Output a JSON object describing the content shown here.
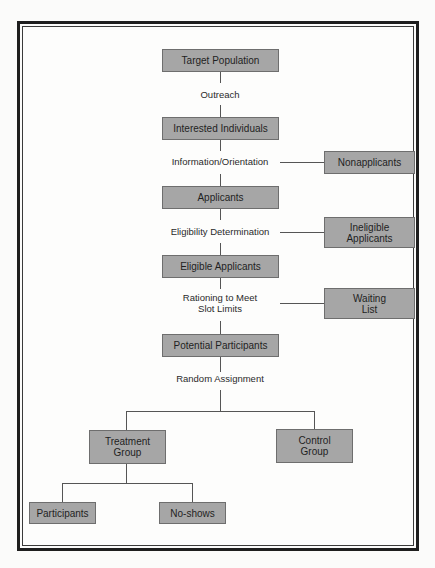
{
  "diagram": {
    "type": "flowchart",
    "main_flow": {
      "nodes": [
        {
          "id": "target_population",
          "label": "Target Population"
        },
        {
          "id": "interested_individuals",
          "label": "Interested Individuals"
        },
        {
          "id": "applicants",
          "label": "Applicants"
        },
        {
          "id": "eligible_applicants",
          "label": "Eligible Applicants"
        },
        {
          "id": "potential_participants",
          "label": "Potential Participants"
        }
      ],
      "steps": [
        {
          "label": "Outreach"
        },
        {
          "label": "Information/Orientation"
        },
        {
          "label": "Eligibility Determination"
        },
        {
          "label": "Rationing to Meet\nSlot Limits"
        },
        {
          "label": "Random Assignment"
        }
      ]
    },
    "side_exits": [
      {
        "from_step": "Information/Orientation",
        "label": "Nonapplicants"
      },
      {
        "from_step": "Eligibility Determination",
        "label": "Ineligible\nApplicants"
      },
      {
        "from_step": "Rationing to Meet Slot Limits",
        "label": "Waiting\nList"
      }
    ],
    "branches": {
      "treatment": {
        "label": "Treatment\nGroup"
      },
      "control": {
        "label": "Control\nGroup"
      },
      "treatment_children": [
        {
          "label": "Participants"
        },
        {
          "label": "No-shows"
        }
      ]
    },
    "colors": {
      "box_fill": "#a6a6a6",
      "frame": "#1e1e1e",
      "line": "#555555"
    }
  }
}
